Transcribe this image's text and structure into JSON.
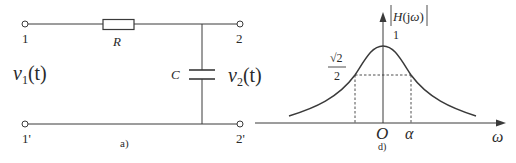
{
  "circuit": {
    "caption": "a)",
    "terminals": {
      "input_top": "1",
      "input_bottom": "1'",
      "output_top": "2",
      "output_bottom": "2'"
    },
    "resistor_label": "R",
    "capacitor_label": "C",
    "input_voltage": {
      "symbol": "v",
      "subscript": "1",
      "arg": "(t)"
    },
    "output_voltage": {
      "symbol": "v",
      "subscript": "2",
      "arg": "(t)"
    }
  },
  "graph": {
    "caption": "d)",
    "y_axis_label": "|H(jω)|",
    "y_tick_peak": "1",
    "y_tick_half_power_num": "√2",
    "y_tick_half_power_den": "2",
    "x_axis_label": "ω",
    "origin_label": "O",
    "cutoff_label": "α"
  },
  "colors": {
    "line": "#3a3a3a",
    "text": "#2a2a2a",
    "background": "#ffffff"
  }
}
